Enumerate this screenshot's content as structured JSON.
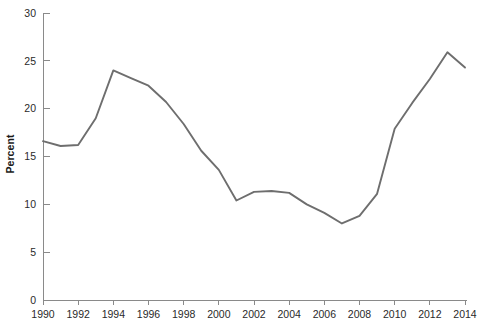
{
  "chart_data": {
    "type": "line",
    "title": "",
    "subtitle": "",
    "xlabel": "",
    "ylabel": "Percent",
    "x": [
      1990,
      1991,
      1992,
      1993,
      1994,
      1995,
      1996,
      1997,
      1998,
      1999,
      2000,
      2001,
      2002,
      2003,
      2004,
      2005,
      2006,
      2007,
      2008,
      2009,
      2010,
      2011,
      2012,
      2013,
      2014
    ],
    "values": [
      16.6,
      16.1,
      16.2,
      19.0,
      24.0,
      23.2,
      22.4,
      20.7,
      18.4,
      15.6,
      13.6,
      10.4,
      11.3,
      11.4,
      11.2,
      10.0,
      9.1,
      8.0,
      8.8,
      11.1,
      17.9,
      20.6,
      23.1,
      25.9,
      24.3
    ],
    "series": [
      {
        "name": "Percent",
        "color": "#6e6e6e",
        "values": [
          16.6,
          16.1,
          16.2,
          19.0,
          24.0,
          23.2,
          22.4,
          20.7,
          18.4,
          15.6,
          13.6,
          10.4,
          11.3,
          11.4,
          11.2,
          10.0,
          9.1,
          8.0,
          8.8,
          11.1,
          17.9,
          20.6,
          23.1,
          25.9,
          24.3
        ]
      }
    ],
    "xlim": [
      1990,
      2014
    ],
    "ylim": [
      0,
      30
    ],
    "ytick_values": [
      0,
      5,
      10,
      15,
      20,
      25,
      30
    ],
    "ytick_labels": [
      "0",
      "5",
      "10",
      "15",
      "20",
      "25",
      "30"
    ],
    "xtick_values": [
      1990,
      1992,
      1994,
      1996,
      1998,
      2000,
      2002,
      2004,
      2006,
      2008,
      2010,
      2012,
      2014
    ],
    "xtick_labels": [
      "1990",
      "1992",
      "1994",
      "1996",
      "1998",
      "2000",
      "2002",
      "2004",
      "2006",
      "2008",
      "2010",
      "2012",
      "2014"
    ],
    "grid": false,
    "legend": false,
    "legend_position": "none",
    "annotations": []
  },
  "axes": {
    "line_color": "#8a8a8a",
    "tick_color": "#8a8a8a",
    "label_color": "#2a2a2a",
    "background": "#ffffff"
  }
}
